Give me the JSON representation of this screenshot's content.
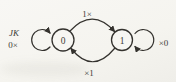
{
  "diagram": {
    "kind": "state-diagram",
    "input_label": "JK",
    "states": [
      {
        "name": "0",
        "self_loop_label": "0×"
      },
      {
        "name": "1",
        "self_loop_label": "×0"
      }
    ],
    "transitions": [
      {
        "from": "0",
        "to": "1",
        "label": "1×"
      },
      {
        "from": "1",
        "to": "0",
        "label": "×1"
      }
    ],
    "colors": {
      "ink": "#34322e",
      "text": "#403c36",
      "background": "#f7f6f2"
    }
  }
}
